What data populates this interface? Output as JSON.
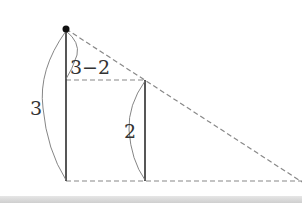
{
  "diagram": {
    "labels": {
      "tall_height": "3",
      "short_height": "2",
      "difference": "3−2"
    },
    "colors": {
      "solid": "#444444",
      "dashed": "#888888",
      "arc": "#777777",
      "dot": "#111111"
    }
  }
}
